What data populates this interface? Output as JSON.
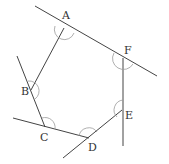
{
  "figure": {
    "type": "hexagon with extended sides showing exterior/interior angle arcs",
    "width": 169,
    "height": 164,
    "colors": {
      "line": "#444444",
      "arc": "#9a9a9a",
      "label": "#333333",
      "background": "#ffffff"
    }
  },
  "vertices": [
    {
      "id": "A",
      "label": "A",
      "x": 64,
      "y": 28,
      "label_x": 62,
      "label_y": 19
    },
    {
      "id": "B",
      "label": "B",
      "x": 31,
      "y": 90,
      "label_x": 21,
      "label_y": 95
    },
    {
      "id": "C",
      "label": "C",
      "x": 45,
      "y": 127,
      "label_x": 40,
      "label_y": 141
    },
    {
      "id": "D",
      "label": "D",
      "x": 89,
      "y": 138,
      "label_x": 88,
      "label_y": 151
    },
    {
      "id": "E",
      "label": "E",
      "x": 122,
      "y": 110,
      "label_x": 125,
      "label_y": 119
    },
    {
      "id": "F",
      "label": "F",
      "x": 123,
      "y": 58,
      "label_x": 124,
      "label_y": 54
    }
  ],
  "lines": [
    {
      "name": "line-through-A-F",
      "x1": 35,
      "y1": 6,
      "x2": 157,
      "y2": 76
    },
    {
      "name": "segment-A-B",
      "x1": 64,
      "y1": 28,
      "x2": 31,
      "y2": 90
    },
    {
      "name": "line-through-B-C",
      "x1": 17,
      "y1": 56,
      "x2": 45,
      "y2": 127
    },
    {
      "name": "line-through-C-D",
      "x1": 13,
      "y1": 118,
      "x2": 89,
      "y2": 138
    },
    {
      "name": "line-through-D-E",
      "x1": 63,
      "y1": 158,
      "x2": 122,
      "y2": 110
    },
    {
      "name": "line-through-F-E",
      "x1": 123,
      "y1": 58,
      "x2": 123,
      "y2": 146
    }
  ],
  "angle_arcs": [
    {
      "vertex": "A",
      "d": "M 55 26 A 10 10 0 0 0 74 33"
    },
    {
      "vertex": "B",
      "d": "M 28 81 A 10 10 0 0 1 35 99"
    },
    {
      "vertex": "C",
      "d": "M 42 118 A 10 10 0 0 1 55 129"
    },
    {
      "vertex": "D",
      "d": "M 79 136 A 10 10 0 0 1 97 132"
    },
    {
      "vertex": "E",
      "d": "M 123 100 A 10 10 0 0 0 117 117"
    },
    {
      "vertex": "F",
      "d": "M 114 53 A 10 10 0 0 0 133 64"
    }
  ]
}
